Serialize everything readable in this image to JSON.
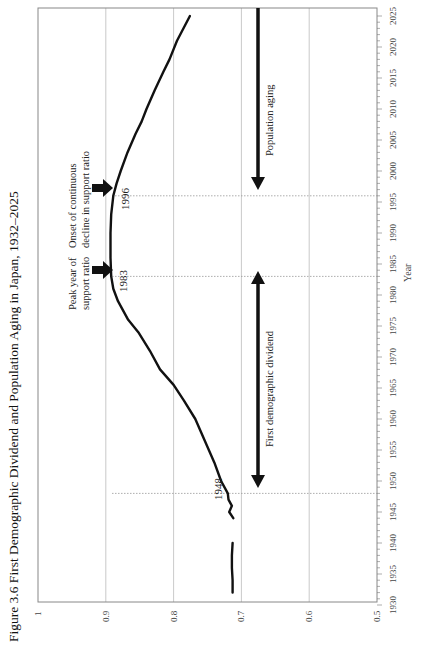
{
  "chart_data": {
    "type": "line",
    "title": "Figure 3.6 First Demographic Dividend and Population Aging in Japan, 1932–2025",
    "orientation": "rotated-90-ccw",
    "xlabel": "Year",
    "ylabel": "",
    "xlim": [
      1930,
      2025
    ],
    "ylim": [
      0.5,
      1.0
    ],
    "x_ticks": [
      "1930",
      "1935",
      "1940",
      "1945",
      "1950",
      "1955",
      "1960",
      "1965",
      "1970",
      "1975",
      "1980",
      "1985",
      "1990",
      "1995",
      "2000",
      "2005",
      "2010",
      "2015",
      "2020",
      "2025"
    ],
    "y_ticks": [
      "0.5",
      "0.6",
      "0.7",
      "0.8",
      "0.9",
      "1"
    ],
    "grid": {
      "y_major": true,
      "x_major": false
    },
    "legend": null,
    "series": [
      {
        "name": "Support ratio",
        "segments": [
          {
            "x": [
              1932,
              1934,
              1936,
              1938,
              1940
            ],
            "y": [
              0.713,
              0.713,
              0.714,
              0.714,
              0.713
            ]
          },
          {
            "x": [
              1944,
              1945,
              1946,
              1947,
              1948,
              1950,
              1953,
              1956,
              1960,
              1963,
              1965.5,
              1968,
              1971,
              1974,
              1976,
              1979,
              1981,
              1983,
              1986,
              1990,
              1993,
              1996,
              1998,
              2000,
              2003,
              2006,
              2008,
              2010,
              2013,
              2016,
              2018,
              2021,
              2025
            ],
            "y": [
              0.712,
              0.718,
              0.714,
              0.719,
              0.72,
              0.73,
              0.74,
              0.752,
              0.768,
              0.785,
              0.8,
              0.82,
              0.835,
              0.852,
              0.867,
              0.882,
              0.889,
              0.892,
              0.893,
              0.893,
              0.892,
              0.889,
              0.884,
              0.878,
              0.868,
              0.856,
              0.847,
              0.84,
              0.828,
              0.815,
              0.806,
              0.795,
              0.776
            ]
          }
        ]
      }
    ],
    "annotations": [
      {
        "type": "vline",
        "x": 1948,
        "label": "1948",
        "style": "dotted"
      },
      {
        "type": "vline",
        "x": 1983,
        "label": "1983",
        "style": "dotted"
      },
      {
        "type": "vline",
        "x": 1996,
        "label": "1996",
        "style": "dotted"
      },
      {
        "type": "arrow",
        "x": 1983,
        "text": [
          "Peak year of",
          "support ratio"
        ]
      },
      {
        "type": "arrow",
        "x": 1996,
        "text": [
          "Onset of continuous",
          "decline in support ratio"
        ]
      },
      {
        "type": "double-arrow",
        "x_range": [
          1948,
          1983
        ],
        "y": 0.675,
        "text": "First demographic dividend"
      },
      {
        "type": "arrow",
        "x_range": [
          1996,
          2025
        ],
        "y": 0.675,
        "text": "Population aging"
      }
    ]
  },
  "labels": {
    "title": "Figure 3.6 First Demographic Dividend and Population Aging in Japan, 1932–2025",
    "xlabel": "Year",
    "peak_line1": "Peak year of",
    "peak_line2": "support ratio",
    "onset_line1": "Onset of continuous",
    "onset_line2": "decline in support ratio",
    "year_1948": "1948",
    "year_1983": "1983",
    "year_1996": "1996",
    "dividend": "First demographic dividend",
    "aging": "Population aging"
  },
  "colors": {
    "line": "#111111",
    "grid": "#bbbbbb",
    "frame": "#888888",
    "guide": "#999999"
  }
}
